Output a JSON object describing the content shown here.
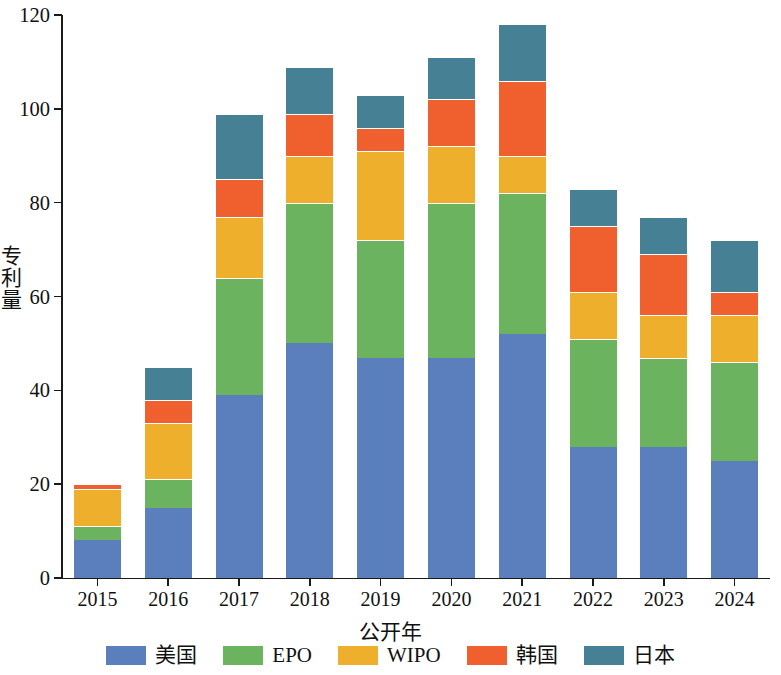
{
  "chart_data": {
    "type": "bar",
    "stacked": true,
    "title": "",
    "xlabel": "公开年",
    "ylabel": "专利量",
    "categories": [
      "2015",
      "2016",
      "2017",
      "2018",
      "2019",
      "2020",
      "2021",
      "2022",
      "2023",
      "2024"
    ],
    "ylim": [
      0,
      120
    ],
    "yticks": [
      0,
      20,
      40,
      60,
      80,
      100,
      120
    ],
    "ytick_labels": [
      "0",
      "20",
      "40",
      "60",
      "80",
      "100",
      "120"
    ],
    "grid": false,
    "legend_position": "bottom",
    "series": [
      {
        "name": "美国",
        "color": "#5b7fbd",
        "values": [
          8,
          15,
          39,
          50,
          47,
          47,
          52,
          28,
          28,
          25
        ]
      },
      {
        "name": "EPO",
        "color": "#6cb35f",
        "values": [
          3,
          6,
          25,
          30,
          25,
          33,
          30,
          23,
          19,
          21
        ]
      },
      {
        "name": "WIPO",
        "color": "#eeb02c",
        "values": [
          8,
          12,
          13,
          10,
          19,
          12,
          8,
          10,
          9,
          10
        ]
      },
      {
        "name": "韩国",
        "color": "#f0602e",
        "values": [
          1,
          5,
          8,
          9,
          5,
          10,
          16,
          14,
          13,
          5
        ]
      },
      {
        "name": "日本",
        "color": "#468095",
        "values": [
          0,
          7,
          14,
          10,
          7,
          9,
          12,
          8,
          8,
          11
        ]
      }
    ],
    "totals": [
      20,
      45,
      99,
      109,
      103,
      111,
      118,
      83,
      77,
      72
    ]
  },
  "legend": {
    "items": [
      {
        "label": "美国",
        "color": "#5b7fbd"
      },
      {
        "label": "EPO",
        "color": "#6cb35f"
      },
      {
        "label": "WIPO",
        "color": "#eeb02c"
      },
      {
        "label": "韩国",
        "color": "#f0602e"
      },
      {
        "label": "日本",
        "color": "#468095"
      }
    ]
  },
  "axes": {
    "y_title": "专利量",
    "x_title": "公开年"
  }
}
